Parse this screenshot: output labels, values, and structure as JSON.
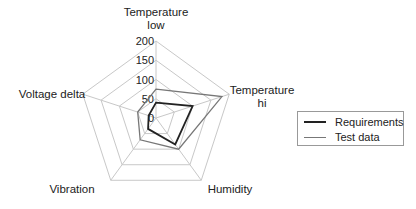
{
  "chart_data": {
    "type": "radar",
    "title": "",
    "axes": [
      "Temperature low",
      "Temperature hi",
      "Humidity",
      "Vibration",
      "Voltage delta"
    ],
    "axis_labels_display": [
      [
        "Temperature",
        "low"
      ],
      [
        "Temperature",
        "hi"
      ],
      [
        "Humidity"
      ],
      [
        "Vibration"
      ],
      [
        "Voltage delta"
      ]
    ],
    "radial_ticks": [
      0,
      50,
      100,
      150,
      200
    ],
    "rlim": [
      0,
      200
    ],
    "grid": true,
    "legend_position": "right",
    "series": [
      {
        "name": "Requirements",
        "color": "#222222",
        "width": 1.8,
        "values": [
          40,
          100,
          85,
          35,
          20
        ]
      },
      {
        "name": "Test data",
        "color": "#777777",
        "width": 1.3,
        "values": [
          75,
          180,
          100,
          70,
          50
        ]
      }
    ]
  },
  "legend": {
    "items": [
      {
        "label": "Requirements",
        "color": "#222222"
      },
      {
        "label": "Test data",
        "color": "#777777"
      }
    ]
  },
  "colors": {
    "grid": "#c8c8c8",
    "text": "#222222"
  }
}
